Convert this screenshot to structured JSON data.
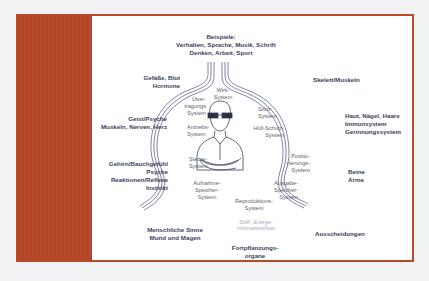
{
  "colors": {
    "frame": "#b84a2a",
    "panel": "#b7482a",
    "content_bg": "#ffffff",
    "label_text": "#3a3f5c",
    "line": "#4a5078"
  },
  "diagram": {
    "top_label": "Beispiele:\nVerhalten, Sprache, Musik, Schrift\nDenken, Arbeit, Sport",
    "outer_labels": {
      "gefaesse": "Gefäße, Blut\nHormone",
      "geist": "Geist/Psyche\nMuskeln, Nerven, Herz",
      "gehirn": "Gehirn/Bauchgefühl\nPsyche\nReaktionen/Reflexe\nInstinkt",
      "sinne": "Menschliche Sinne\nMund und Magen",
      "skelett": "Skelett/Muskeln",
      "haut": "Haut, Nägel, Haare\nImmunsystem\nGerinnungssystem",
      "beine": "Beine\nArme",
      "ausscheidungen": "Ausscheidungen",
      "fortpflanzung": "Fortpflanzungs-\norgane"
    },
    "systems": {
      "wirk": "Wirk-\nSystem",
      "uebertragung": "Über-\ntragungs\nSystem",
      "antrieb": "Antriebs-\nSystem",
      "steuer": "Steuer-\nSystem",
      "aufnahme": "Aufnahme-\nSpeicher-\nSystem",
      "reproduktion": "Reproduktions-\nSystem",
      "stuetz": "Stütz-\nSystem",
      "huell": "Hüll-Schutz-\nSystem",
      "positionierung": "Positio-\nnierungs-\nSystem",
      "ausgabe": "Ausgabe-\nSpeicher-\nSystem"
    },
    "flow_note": "Stoff-, Energie-\nInformationsfluss",
    "center_figure": "person-with-glasses-icon"
  }
}
